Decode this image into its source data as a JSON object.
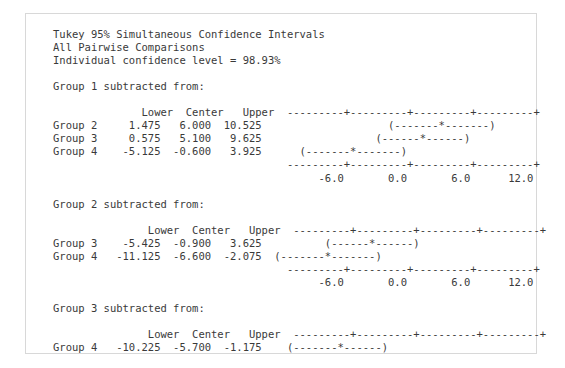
{
  "panel": {
    "border_color": "#d8d8d8",
    "background": "#ffffff",
    "text_color": "#3a3a3a"
  },
  "header": {
    "line1": "Tukey 95% Simultaneous Confidence Intervals",
    "line2": "All Pairwise Comparisons",
    "line3": "Individual confidence level = 98.93%"
  },
  "columns": {
    "lower": "Lower",
    "center": "Center",
    "upper": "Upper"
  },
  "axis": {
    "tick_labels": [
      "-6.0",
      "0.0",
      "6.0",
      "12.0"
    ],
    "rule": "---------+---------+---------+---------+",
    "labels_row": "      -6.0       0.0       6.0      12.0"
  },
  "sections": [
    {
      "title": "Group 1 subtracted from:",
      "header_row": "              Lower  Center   Upper  ---------+---------+---------+---------+",
      "rows": [
        {
          "label": "Group 2",
          "lower": "1.475",
          "center": "6.000",
          "upper": "10.525",
          "plot": "                                     (-------*-------)",
          "line": "Group 2     1.475   6.000  10.525                    (-------*-------)"
        },
        {
          "label": "Group 3",
          "lower": "0.575",
          "center": "5.100",
          "upper": "9.625",
          "plot": "                                   (------*------)",
          "line": "Group 3     0.575   5.100   9.625                  (------*------)"
        },
        {
          "label": "Group 4",
          "lower": "-5.125",
          "center": "-0.600",
          "upper": "3.925",
          "plot": "                       (-------*-------)",
          "line": "Group 4    -5.125  -0.600   3.925      (-------*-------)"
        }
      ],
      "axis_rule_line": "                                     ---------+---------+---------+---------+",
      "axis_label_line": "                                          -6.0       0.0       6.0      12.0",
      "has_bottom_axis": true
    },
    {
      "title": "Group 2 subtracted from:",
      "header_row": "               Lower  Center   Upper  ---------+---------+---------+---------+",
      "rows": [
        {
          "label": "Group 3",
          "lower": "-5.425",
          "center": "-0.900",
          "upper": "3.625",
          "plot": "                           (------*------)",
          "line": "Group 3    -5.425  -0.900   3.625          (------*------)"
        },
        {
          "label": "Group 4",
          "lower": "-11.125",
          "center": "-6.600",
          "upper": "-2.075",
          "plot": "             (-------*-------)",
          "line": "Group 4   -11.125  -6.600  -2.075  (-------*-------)"
        }
      ],
      "axis_rule_line": "                                     ---------+---------+---------+---------+",
      "axis_label_line": "                                          -6.0       0.0       6.0      12.0",
      "has_bottom_axis": true
    },
    {
      "title": "Group 3 subtracted from:",
      "header_row": "               Lower  Center   Upper  ---------+---------+---------+---------+",
      "rows": [
        {
          "label": "Group 4",
          "lower": "-10.225",
          "center": "-5.700",
          "upper": "-1.175",
          "plot": "                 (-------*------)",
          "line": "Group 4   -10.225  -5.700  -1.175    (-------*------)"
        }
      ],
      "axis_rule_line": "",
      "axis_label_line": "",
      "has_bottom_axis": false
    }
  ],
  "chart_data": {
    "type": "line",
    "title": "Tukey 95% Simultaneous Confidence Intervals",
    "subtitle": "All Pairwise Comparisons",
    "annotation": "Individual confidence level = 98.93%",
    "xlabel": "",
    "ylabel": "",
    "xlim": [
      -9.0,
      15.0
    ],
    "grid": false,
    "legend": "none",
    "axis_ticks": [
      -6.0,
      0.0,
      6.0,
      12.0
    ],
    "series": [
      {
        "name": "Group 1 subtracted from: Group 2",
        "lower": 1.475,
        "center": 6.0,
        "upper": 10.525
      },
      {
        "name": "Group 1 subtracted from: Group 3",
        "lower": 0.575,
        "center": 5.1,
        "upper": 9.625
      },
      {
        "name": "Group 1 subtracted from: Group 4",
        "lower": -5.125,
        "center": -0.6,
        "upper": 3.925
      },
      {
        "name": "Group 2 subtracted from: Group 3",
        "lower": -5.425,
        "center": -0.9,
        "upper": 3.625
      },
      {
        "name": "Group 2 subtracted from: Group 4",
        "lower": -11.125,
        "center": -6.6,
        "upper": -2.075
      },
      {
        "name": "Group 3 subtracted from: Group 4",
        "lower": -10.225,
        "center": -5.7,
        "upper": -1.175
      }
    ]
  }
}
